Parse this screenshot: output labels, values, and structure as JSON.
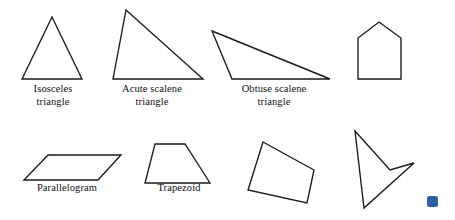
{
  "figure": {
    "background_color": "#ffffff",
    "stroke_color": "#1a1a1a",
    "marker_color": "#2e5fa3"
  },
  "captions": {
    "isosceles": "Isosceles\ntriangle",
    "acute_scalene": "Acute scalene\ntriangle",
    "obtuse_scalene": "Obtuse scalene\ntriangle",
    "parallelogram": "Parallelogram",
    "trapezoid": "Trapezoid"
  },
  "shapes": {
    "isosceles_triangle": {
      "name": "Isosceles triangle",
      "sides": 3,
      "points": "52,17 82,79 22,79"
    },
    "acute_scalene_triangle": {
      "name": "Acute scalene triangle",
      "sides": 3,
      "points": "126,10 203,79 113,79"
    },
    "obtuse_scalene_triangle": {
      "name": "Obtuse scalene triangle",
      "sides": 3,
      "points": "212,31 330,79 232,79"
    },
    "pentagon_house": {
      "name": "Pentagon",
      "sides": 5,
      "points": "379,22 401,38 401,79 358,79 358,38"
    },
    "parallelogram": {
      "name": "Parallelogram",
      "sides": 4,
      "points": "48,155 121,155 98,180 24,180"
    },
    "trapezoid": {
      "name": "Trapezoid",
      "sides": 4,
      "points": "155,144 185,144 210,183 145,183"
    },
    "convex_quadrilateral": {
      "name": "Quadrilateral",
      "sides": 4,
      "points": "263,142 314,170 307,203 248,190"
    },
    "concave_dart_quadrilateral": {
      "name": "Concave quadrilateral",
      "sides": 4,
      "points": "355,131 390,170 414,163 364,208"
    }
  },
  "marker": {
    "name": "blue square marker",
    "color": "#2e5fa3"
  }
}
